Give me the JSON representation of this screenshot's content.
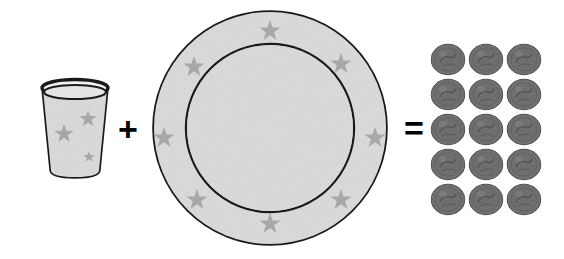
{
  "scene": {
    "title": "Cup plus plate equals fifteen coins",
    "background_color": "#ffffff",
    "width": 564,
    "height": 259
  },
  "operators": {
    "plus": "+",
    "equals": "="
  },
  "cup": {
    "name": "cup",
    "fill_color": "#dcdcdc",
    "outline_color": "#1a1a1a",
    "star_color": "#a8a8a8",
    "star_count": 3,
    "stars": [
      {
        "cx": 88,
        "cy": 119,
        "r": 9
      },
      {
        "cx": 64,
        "cy": 134,
        "r": 10
      },
      {
        "cx": 89,
        "cy": 157,
        "r": 6
      }
    ],
    "geometry": {
      "rim_cx": 75,
      "rim_cy": 89,
      "rim_rx": 33,
      "rim_ry": 8,
      "base_cx": 75,
      "base_cy": 172,
      "base_rx": 24,
      "base_ry": 5
    }
  },
  "plate": {
    "name": "plate",
    "fill_color": "#dcdcdc",
    "outline_color": "#1a1a1a",
    "star_color": "#a8a8a8",
    "star_count": 8,
    "center_x": 270,
    "center_y": 128,
    "outer_radius": 117,
    "inner_radius": 84,
    "stars": [
      {
        "cx": 270,
        "cy": 31,
        "r": 11
      },
      {
        "cx": 341,
        "cy": 64,
        "r": 11
      },
      {
        "cx": 375,
        "cy": 138,
        "r": 11
      },
      {
        "cx": 341,
        "cy": 200,
        "r": 11
      },
      {
        "cx": 270,
        "cy": 224,
        "r": 11
      },
      {
        "cx": 197,
        "cy": 200,
        "r": 11
      },
      {
        "cx": 164,
        "cy": 138,
        "r": 11
      },
      {
        "cx": 194,
        "cy": 67,
        "r": 11
      }
    ]
  },
  "coins": {
    "name": "coin-grid",
    "total": 15,
    "rows": 5,
    "columns": 3,
    "fill_color": "#777777",
    "outline_color": "#4a4a4a",
    "shade_color": "#5e5e5e",
    "items": [
      {
        "row": 1,
        "col": 1
      },
      {
        "row": 1,
        "col": 2
      },
      {
        "row": 1,
        "col": 3
      },
      {
        "row": 2,
        "col": 1
      },
      {
        "row": 2,
        "col": 2
      },
      {
        "row": 2,
        "col": 3
      },
      {
        "row": 3,
        "col": 1
      },
      {
        "row": 3,
        "col": 2
      },
      {
        "row": 3,
        "col": 3
      },
      {
        "row": 4,
        "col": 1
      },
      {
        "row": 4,
        "col": 2
      },
      {
        "row": 4,
        "col": 3
      },
      {
        "row": 5,
        "col": 1
      },
      {
        "row": 5,
        "col": 2
      },
      {
        "row": 5,
        "col": 3
      }
    ]
  }
}
